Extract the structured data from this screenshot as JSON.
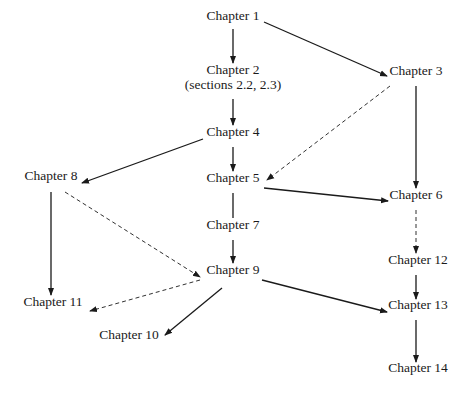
{
  "diagram": {
    "type": "dependency-graph",
    "nodes": [
      {
        "id": "ch1",
        "label": "Chapter 1",
        "sub": "",
        "x": 233,
        "y": 16
      },
      {
        "id": "ch2",
        "label": "Chapter 2",
        "sub": "(sections 2.2, 2.3)",
        "x": 233,
        "y": 70
      },
      {
        "id": "ch3",
        "label": "Chapter 3",
        "sub": "",
        "x": 416,
        "y": 71
      },
      {
        "id": "ch4",
        "label": "Chapter 4",
        "sub": "",
        "x": 233,
        "y": 132
      },
      {
        "id": "ch5",
        "label": "Chapter 5",
        "sub": "",
        "x": 233,
        "y": 178
      },
      {
        "id": "ch6",
        "label": "Chapter 6",
        "sub": "",
        "x": 416,
        "y": 195
      },
      {
        "id": "ch7",
        "label": "Chapter 7",
        "sub": "",
        "x": 233,
        "y": 225
      },
      {
        "id": "ch8",
        "label": "Chapter 8",
        "sub": "",
        "x": 51,
        "y": 176
      },
      {
        "id": "ch9",
        "label": "Chapter 9",
        "sub": "",
        "x": 233,
        "y": 270
      },
      {
        "id": "ch10",
        "label": "Chapter 10",
        "sub": "",
        "x": 129,
        "y": 335
      },
      {
        "id": "ch11",
        "label": "Chapter 11",
        "sub": "",
        "x": 53,
        "y": 302
      },
      {
        "id": "ch12",
        "label": "Chapter 12",
        "sub": "",
        "x": 418,
        "y": 260
      },
      {
        "id": "ch13",
        "label": "Chapter 13",
        "sub": "",
        "x": 418,
        "y": 305
      },
      {
        "id": "ch14",
        "label": "Chapter 14",
        "sub": "",
        "x": 418,
        "y": 368
      }
    ],
    "edges": [
      {
        "from": "ch1",
        "to": "ch2",
        "style": "solid",
        "arrow": true,
        "x1": 233,
        "y1": 29,
        "x2": 233,
        "y2": 63
      },
      {
        "from": "ch1",
        "to": "ch3",
        "style": "solid",
        "arrow": true,
        "x1": 264,
        "y1": 22,
        "x2": 387,
        "y2": 76
      },
      {
        "from": "ch2",
        "to": "ch4",
        "style": "solid",
        "arrow": true,
        "x1": 233,
        "y1": 99,
        "x2": 233,
        "y2": 125
      },
      {
        "from": "ch3",
        "to": "ch5",
        "style": "dashed",
        "arrow": true,
        "x1": 390,
        "y1": 86,
        "x2": 267,
        "y2": 180
      },
      {
        "from": "ch3",
        "to": "ch6",
        "style": "solid",
        "arrow": true,
        "x1": 416,
        "y1": 86,
        "x2": 416,
        "y2": 188
      },
      {
        "from": "ch4",
        "to": "ch8",
        "style": "solid",
        "arrow": true,
        "x1": 203,
        "y1": 139,
        "x2": 82,
        "y2": 183
      },
      {
        "from": "ch4",
        "to": "ch5",
        "style": "solid",
        "arrow": true,
        "x1": 233,
        "y1": 147,
        "x2": 233,
        "y2": 171
      },
      {
        "from": "ch5",
        "to": "ch6",
        "style": "solid",
        "arrow": true,
        "x1": 264,
        "y1": 188,
        "x2": 388,
        "y2": 201
      },
      {
        "from": "ch5",
        "to": "ch7",
        "style": "solid",
        "arrow": false,
        "x1": 233,
        "y1": 193,
        "x2": 233,
        "y2": 218
      },
      {
        "from": "ch7",
        "to": "ch9",
        "style": "solid",
        "arrow": true,
        "x1": 233,
        "y1": 240,
        "x2": 233,
        "y2": 263
      },
      {
        "from": "ch8",
        "to": "ch9",
        "style": "dashed",
        "arrow": true,
        "x1": 65,
        "y1": 192,
        "x2": 200,
        "y2": 277
      },
      {
        "from": "ch8",
        "to": "ch11",
        "style": "solid",
        "arrow": true,
        "x1": 51,
        "y1": 192,
        "x2": 51,
        "y2": 295
      },
      {
        "from": "ch9",
        "to": "ch11",
        "style": "dashed",
        "arrow": true,
        "x1": 200,
        "y1": 280,
        "x2": 90,
        "y2": 311
      },
      {
        "from": "ch9",
        "to": "ch10",
        "style": "solid",
        "arrow": true,
        "x1": 222,
        "y1": 288,
        "x2": 165,
        "y2": 335
      },
      {
        "from": "ch9",
        "to": "ch13",
        "style": "solid",
        "arrow": true,
        "x1": 262,
        "y1": 280,
        "x2": 387,
        "y2": 312
      },
      {
        "from": "ch6",
        "to": "ch12",
        "style": "dashed",
        "arrow": true,
        "x1": 416,
        "y1": 210,
        "x2": 416,
        "y2": 253
      },
      {
        "from": "ch12",
        "to": "ch13",
        "style": "solid",
        "arrow": true,
        "x1": 416,
        "y1": 275,
        "x2": 416,
        "y2": 299
      },
      {
        "from": "ch13",
        "to": "ch14",
        "style": "solid",
        "arrow": true,
        "x1": 416,
        "y1": 320,
        "x2": 416,
        "y2": 362
      }
    ],
    "colors": {
      "background": "#ffffff",
      "line": "#1a1a1a",
      "text": "#1a1a1a"
    }
  }
}
